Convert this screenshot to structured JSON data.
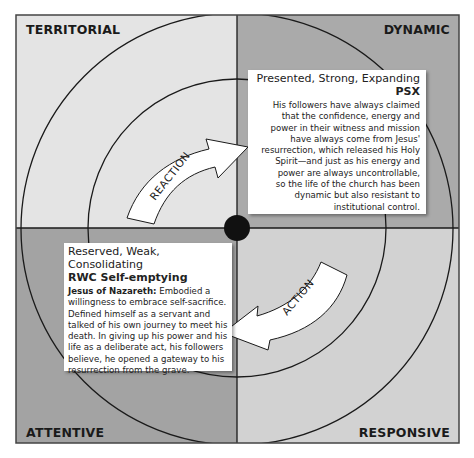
{
  "quadrants": {
    "top_left": {
      "label": "TERRITORIAL",
      "color": "#e4e4e4"
    },
    "top_right": {
      "label": "DYNAMIC",
      "color": "#aaaaaa"
    },
    "bottom_left": {
      "label": "ATTENTIVE",
      "color": "#a3a3a3"
    },
    "bottom_right": {
      "label": "RESPONSIVE",
      "color": "#d2d2d2"
    }
  },
  "arrows": {
    "upper": {
      "label": "REACTION"
    },
    "lower": {
      "label": "ACTION"
    }
  },
  "boxes": {
    "psx": {
      "title": "Presented, Strong, Expanding",
      "subtitle": "PSX",
      "lines": [
        "His followers have always claimed",
        "that the confidence, energy and",
        "power in their witness and mission",
        "have always come from Jesus'",
        "resurrection, which released his Holy",
        "Spirit—and just as his energy and",
        "power are always uncontrollable,",
        "so the life of the church has been",
        "dynamic but also resistant to",
        "institutional control."
      ]
    },
    "rwc": {
      "title": "Reserved, Weak, Consolidating",
      "subtitle": "RWC Self-emptying",
      "lead": "Jesus of Nazareth:",
      "lines": [
        " Embodied a",
        "willingness to embrace self-sacrifice.",
        "Defined himself as a servant and",
        "talked of his own journey to meet his",
        "death. In giving up his power and his",
        "life as a deliberate act, his followers",
        "believe, he opened a gateway to his",
        "resurrection from the grave."
      ]
    }
  }
}
